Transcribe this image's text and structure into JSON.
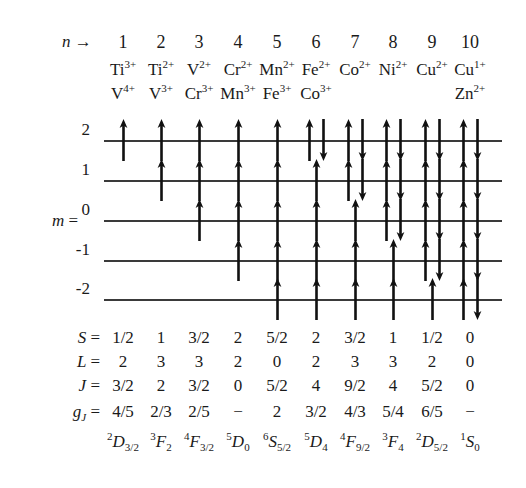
{
  "figure": {
    "axis_labels": {
      "n_label": "n",
      "n_arrow": "→",
      "m_label": "m =",
      "S_label": "S =",
      "L_label": "L =",
      "J_label": "J =",
      "gJ_label": "g",
      "gJ_sub": "J",
      "gJ_eq": "="
    },
    "column_numbers": [
      "1",
      "2",
      "3",
      "4",
      "5",
      "6",
      "7",
      "8",
      "9",
      "10"
    ],
    "ions_row1": [
      {
        "element": "Ti",
        "charge": "3+"
      },
      {
        "element": "Ti",
        "charge": "2+"
      },
      {
        "element": "V",
        "charge": "2+"
      },
      {
        "element": "Cr",
        "charge": "2+"
      },
      {
        "element": "Mn",
        "charge": "2+"
      },
      {
        "element": "Fe",
        "charge": "2+"
      },
      {
        "element": "Co",
        "charge": "2+"
      },
      {
        "element": "Ni",
        "charge": "2+"
      },
      {
        "element": "Cu",
        "charge": "2+"
      },
      {
        "element": "Cu",
        "charge": "1+"
      }
    ],
    "ions_row2": [
      {
        "element": "V",
        "charge": "4+"
      },
      {
        "element": "V",
        "charge": "3+"
      },
      {
        "element": "Cr",
        "charge": "3+"
      },
      {
        "element": "Mn",
        "charge": "3+"
      },
      {
        "element": "Fe",
        "charge": "3+"
      },
      {
        "element": "Co",
        "charge": "3+"
      },
      {
        "element": "",
        "charge": ""
      },
      {
        "element": "",
        "charge": ""
      },
      {
        "element": "",
        "charge": ""
      },
      {
        "element": "Zn",
        "charge": "2+"
      }
    ],
    "m_levels": [
      "2",
      "1",
      "0",
      "-1",
      "-2"
    ],
    "occupancy": [
      {
        "m": "2",
        "up": [
          1,
          1,
          1,
          1,
          1,
          1,
          1,
          1,
          1,
          1
        ],
        "down": [
          0,
          0,
          0,
          0,
          0,
          1,
          1,
          1,
          1,
          1
        ]
      },
      {
        "m": "1",
        "up": [
          0,
          1,
          1,
          1,
          1,
          1,
          1,
          1,
          1,
          1
        ],
        "down": [
          0,
          0,
          0,
          0,
          0,
          0,
          1,
          1,
          1,
          1
        ]
      },
      {
        "m": "0",
        "up": [
          0,
          0,
          1,
          1,
          1,
          1,
          1,
          1,
          1,
          1
        ],
        "down": [
          0,
          0,
          0,
          0,
          0,
          0,
          0,
          1,
          1,
          1
        ]
      },
      {
        "m": "-1",
        "up": [
          0,
          0,
          0,
          1,
          1,
          1,
          1,
          1,
          1,
          1
        ],
        "down": [
          0,
          0,
          0,
          0,
          0,
          0,
          0,
          0,
          1,
          1
        ]
      },
      {
        "m": "-2",
        "up": [
          0,
          0,
          0,
          0,
          1,
          1,
          1,
          1,
          1,
          1
        ],
        "down": [
          0,
          0,
          0,
          0,
          0,
          0,
          0,
          0,
          0,
          1
        ]
      }
    ],
    "S_values": [
      "1/2",
      "1",
      "3/2",
      "2",
      "5/2",
      "2",
      "3/2",
      "1",
      "1/2",
      "0"
    ],
    "L_values": [
      "2",
      "3",
      "3",
      "2",
      "0",
      "2",
      "3",
      "3",
      "2",
      "0"
    ],
    "J_values": [
      "3/2",
      "2",
      "3/2",
      "0",
      "5/2",
      "4",
      "9/2",
      "4",
      "5/2",
      "0"
    ],
    "gJ_values": [
      "4/5",
      "2/3",
      "2/5",
      "−",
      "2",
      "3/2",
      "4/3",
      "5/4",
      "6/5",
      "−"
    ],
    "term_symbols": [
      {
        "mult": "2",
        "letter": "D",
        "j": "3/2"
      },
      {
        "mult": "3",
        "letter": "F",
        "j": "2"
      },
      {
        "mult": "4",
        "letter": "F",
        "j": "3/2"
      },
      {
        "mult": "5",
        "letter": "D",
        "j": "0"
      },
      {
        "mult": "6",
        "letter": "S",
        "j": "5/2"
      },
      {
        "mult": "5",
        "letter": "D",
        "j": "4"
      },
      {
        "mult": "4",
        "letter": "F",
        "j": "9/2"
      },
      {
        "mult": "3",
        "letter": "F",
        "j": "4"
      },
      {
        "mult": "2",
        "letter": "D",
        "j": "5/2"
      },
      {
        "mult": "1",
        "letter": "S",
        "j": "0"
      }
    ],
    "colors": {
      "ink": "#1a1a1a",
      "line": "#3a3a3a",
      "background": "#ffffff"
    }
  }
}
